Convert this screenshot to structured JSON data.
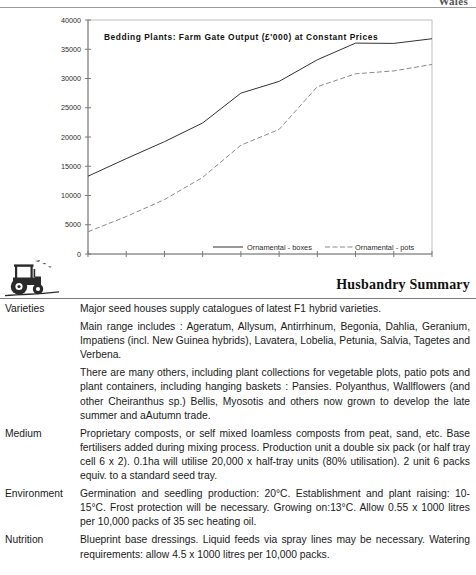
{
  "header": {
    "cut_text": "Wales"
  },
  "chart_data": {
    "type": "line",
    "title": "Bedding Plants:  Farm  Gate  Output  (£'000)  at  Constant  Prices",
    "xlabel": "",
    "ylabel": "",
    "categories": [
      "1984",
      "1985",
      "1986",
      "1987",
      "1988",
      "1989",
      "1990",
      "1991",
      "1992",
      "1993"
    ],
    "x": [
      1984,
      1985,
      1986,
      1987,
      1988,
      1989,
      1990,
      1991,
      1992,
      1993
    ],
    "ytick_labels": [
      "0",
      "5000",
      "10000",
      "15000",
      "20000",
      "25000",
      "30000",
      "35000",
      "40000"
    ],
    "ytick_values": [
      0,
      5000,
      10000,
      15000,
      20000,
      25000,
      30000,
      35000,
      40000
    ],
    "ylim": [
      0,
      40000
    ],
    "xlim": [
      1984,
      1993
    ],
    "grid": false,
    "legend_position": "inside-bottom",
    "series": [
      {
        "name": "Ornamental - boxes",
        "style": "solid",
        "color": "#333333",
        "values": [
          13300,
          16300,
          19200,
          22400,
          27500,
          29500,
          33200,
          36050,
          36000,
          36800
        ]
      },
      {
        "name": "Ornamental - pots",
        "style": "dashed",
        "color": "#8a8a8a",
        "values": [
          3800,
          6400,
          9300,
          13100,
          18600,
          21300,
          28600,
          30800,
          31300,
          32400
        ]
      }
    ]
  },
  "summary": {
    "heading": "Husbandry Summary",
    "tractor_icon": "tractor-icon"
  },
  "sections": [
    {
      "label": "Varieties",
      "paragraphs": [
        "Major seed houses supply catalogues of latest F1 hybrid varieties.",
        "Main range includes : Ageratum, Allysum, Antirrhinum, Begonia, Dahlia, Geranium, Impatiens (incl. New Guinea hybrids), Lavatera, Lobelia, Petunia, Salvia, Tagetes and Verbena.",
        "There are many others, including plant collections for vegetable plots, patio pots and plant containers, including hanging baskets : Pansies. Polyanthus, Wallflowers (and other Cheiranthus sp.) Bellis, Myosotis and others now grown to develop the late summer and aAutumn trade."
      ]
    },
    {
      "label": "Medium",
      "paragraphs": [
        "Proprietary composts, or self mixed loamless composts from peat, sand, etc. Base fertilisers added during mixing process. Production unit a double six pack (or half tray cell 6 x 2). 0.1ha will utilise 20,000 x half-tray units (80% utilisation). 2 unit 6 packs equiv. to a standard seed tray."
      ]
    },
    {
      "label": "Environment",
      "paragraphs": [
        "Germination and seedling production: 20°C. Establishment and plant raising: 10-15°C. Frost protection will be necessary. Growing on:13°C. Allow 0.55 x 1000 litres per 10,000 packs of 35 sec heating oil."
      ]
    },
    {
      "label": "Nutrition",
      "paragraphs": [
        "Blueprint base dressings. Liquid feeds via spray lines may be necessary. Watering requirements: allow 4.5 x 1000 litres per 10,000 packs."
      ]
    }
  ]
}
